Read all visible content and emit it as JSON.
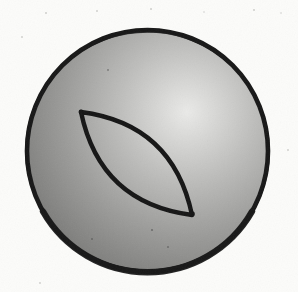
{
  "figure": {
    "background_color": "#fcfcfa",
    "ink_color": "#161616",
    "sphere": {
      "shading_style": "radial highlight toward upper right",
      "highlight_color": "#eaeae8",
      "light_mid_color": "#c0c0be",
      "mid_color": "#9b9b99",
      "edge_color": "#6f6f6d",
      "speck_color": "#3c3c3c"
    },
    "lune": {
      "outline_color": "#141414",
      "fill": "none"
    },
    "paper": {
      "speckle_color": "#a8a8a4"
    }
  }
}
